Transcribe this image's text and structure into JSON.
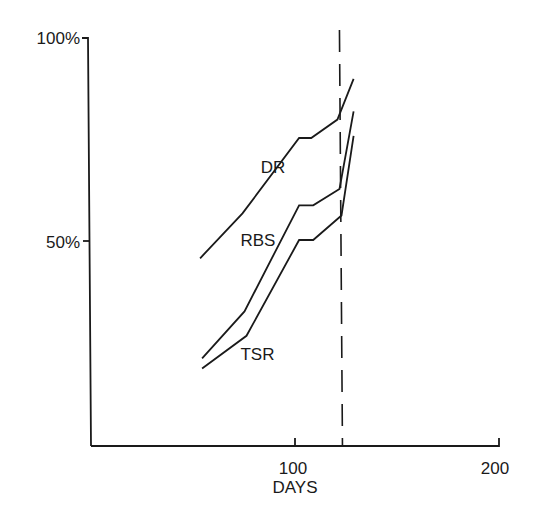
{
  "chart_data": {
    "type": "line",
    "title": "",
    "xlabel": "DAYS",
    "ylabel": "",
    "xlim": [
      0,
      200
    ],
    "ylim": [
      0,
      100
    ],
    "x_ticks": [
      {
        "value": 100,
        "label": "100"
      },
      {
        "value": 200,
        "label": "200"
      }
    ],
    "y_ticks": [
      {
        "value": 50,
        "label": "50%"
      },
      {
        "value": 100,
        "label": "100%"
      }
    ],
    "grid": false,
    "legend": "inline labels",
    "reference_line": {
      "orientation": "vertical",
      "x": 123,
      "style": "dashed"
    },
    "series": [
      {
        "name": "DR",
        "x": [
          54,
          75,
          103,
          109,
          122,
          130
        ],
        "values": [
          46,
          57,
          75.5,
          75.5,
          80,
          90
        ],
        "label_pos": {
          "x": 84,
          "y": 67
        }
      },
      {
        "name": "RBS",
        "x": [
          55,
          76,
          103,
          110,
          123,
          130
        ],
        "values": [
          21.5,
          33,
          59,
          59,
          63,
          82
        ],
        "label_pos": {
          "x": 74,
          "y": 49
        }
      },
      {
        "name": "TSR",
        "x": [
          55,
          77,
          103,
          110,
          124,
          130
        ],
        "values": [
          19,
          27,
          50.5,
          50.5,
          56.5,
          76
        ],
        "label_pos": {
          "x": 74,
          "y": 21
        }
      }
    ]
  }
}
